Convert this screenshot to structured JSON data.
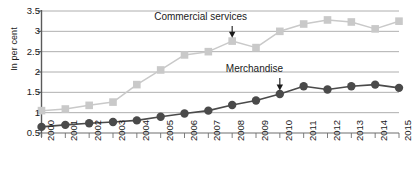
{
  "chart_data": {
    "type": "line",
    "title": "",
    "xlabel": "",
    "ylabel": "In per cent",
    "ylim": [
      0.5,
      3.5
    ],
    "yticks": [
      0.5,
      1,
      1.5,
      2,
      2.5,
      3,
      3.5
    ],
    "ytick_labels": [
      "0.5",
      "1",
      "1.5",
      "2",
      "2.5",
      "3",
      "3.5"
    ],
    "grid": true,
    "legend": "none",
    "categories": [
      "2000",
      "2001",
      "2002",
      "2003",
      "2004",
      "2005",
      "2006",
      "2007",
      "2008",
      "2009",
      "2010",
      "2011",
      "2012",
      "2013",
      "2014",
      "2015"
    ],
    "series": [
      {
        "name": "Commercial services",
        "color": "#c9c9c9",
        "marker": "square",
        "values": [
          1.05,
          1.09,
          1.18,
          1.26,
          1.69,
          2.05,
          2.42,
          2.5,
          2.76,
          2.6,
          3.0,
          3.18,
          3.28,
          3.23,
          3.06,
          3.25
        ]
      },
      {
        "name": "Merchandise",
        "color": "#4a4a4a",
        "marker": "circle",
        "values": [
          0.65,
          0.7,
          0.74,
          0.77,
          0.81,
          0.9,
          0.98,
          1.05,
          1.19,
          1.3,
          1.46,
          1.65,
          1.57,
          1.65,
          1.69,
          1.61
        ]
      }
    ],
    "annotations": [
      {
        "label": "Commercial services",
        "points_to_year": "2008",
        "points_to_value": 2.76,
        "arrow": "down"
      },
      {
        "label": "Merchandise",
        "points_to_year": "2010",
        "points_to_value": 1.46,
        "arrow": "down"
      }
    ]
  }
}
